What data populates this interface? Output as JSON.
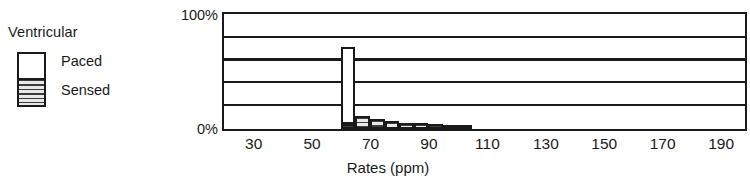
{
  "legend": {
    "title": "Ventricular",
    "items": [
      {
        "label": "Paced",
        "swatch": "white-swatch"
      },
      {
        "label": "Sensed",
        "swatch": "hatched-swatch"
      }
    ]
  },
  "axes": {
    "x_title": "Rates (ppm)",
    "x_ticks": [
      "30",
      "50",
      "70",
      "90",
      "110",
      "130",
      "150",
      "170",
      "190"
    ],
    "y_ticks": [
      "100%",
      "0%"
    ]
  },
  "chart_data": {
    "type": "bar",
    "title": "",
    "subtitle": "",
    "xlabel": "Rates (ppm)",
    "ylabel": "",
    "xlim": [
      20,
      198
    ],
    "ylim": [
      0,
      100
    ],
    "xtick_values": [
      30,
      50,
      70,
      90,
      110,
      130,
      150,
      170,
      190
    ],
    "ytick_values": [
      0,
      100
    ],
    "ytick_labels": [
      "0%",
      "100%"
    ],
    "grid": "horizontal",
    "gridline_values": [
      20,
      40,
      60,
      80
    ],
    "legend_position": "left-outside",
    "stacked": true,
    "bin_width": 5,
    "x": [
      60,
      65,
      70,
      75,
      80,
      85,
      90,
      95,
      100
    ],
    "series": [
      {
        "name": "Paced",
        "color": "#ffffff",
        "values": [
          68,
          0,
          0,
          0,
          0,
          0,
          0,
          0,
          0
        ]
      },
      {
        "name": "Sensed",
        "color": "#dcdcdc",
        "values": [
          4,
          11,
          9,
          7,
          5,
          5,
          4,
          2,
          1
        ]
      }
    ]
  }
}
